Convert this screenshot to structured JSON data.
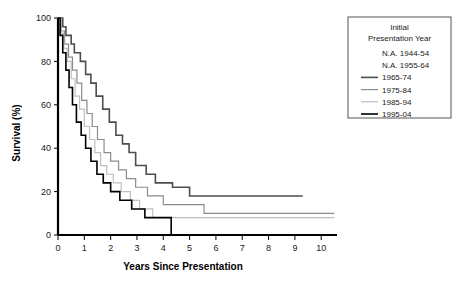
{
  "chart_data": {
    "type": "line",
    "title": "",
    "xlabel": "Years Since Presentation",
    "ylabel": "Survival (%)",
    "xlim": [
      0,
      10.6
    ],
    "ylim": [
      0,
      100
    ],
    "xticks": [
      "0",
      "1",
      "2",
      "3",
      "4",
      "5",
      "6",
      "7",
      "8",
      "9",
      "10"
    ],
    "yticks": [
      "0",
      "20",
      "40",
      "60",
      "80",
      "100"
    ],
    "grid": false,
    "step_style": "post",
    "legend": {
      "position": "top-right",
      "title_line1": "Initial",
      "title_line2": "Presentation Year",
      "entries": [
        {
          "label": "N.A. 1944-54",
          "color": "#ffffff",
          "has_line": false,
          "width": 0
        },
        {
          "label": "N.A. 1955-64",
          "color": "#ffffff",
          "has_line": false,
          "width": 0
        },
        {
          "label": "1965-74",
          "color": "#4d4d4d",
          "has_line": true,
          "width": 1.6
        },
        {
          "label": "1975-84",
          "color": "#8c8c8c",
          "has_line": true,
          "width": 1.2
        },
        {
          "label": "1985-94",
          "color": "#bfbfbf",
          "has_line": true,
          "width": 1.2
        },
        {
          "label": "1995-04",
          "color": "#000000",
          "has_line": true,
          "width": 1.6
        }
      ]
    },
    "series": [
      {
        "name": "1965-74",
        "color": "#4d4d4d",
        "width": 1.6,
        "points": [
          [
            0.0,
            100
          ],
          [
            0.18,
            100
          ],
          [
            0.18,
            96
          ],
          [
            0.3,
            96
          ],
          [
            0.3,
            92
          ],
          [
            0.5,
            92
          ],
          [
            0.5,
            88
          ],
          [
            0.62,
            88
          ],
          [
            0.62,
            84
          ],
          [
            0.85,
            84
          ],
          [
            0.85,
            80
          ],
          [
            1.05,
            80
          ],
          [
            1.05,
            74
          ],
          [
            1.25,
            74
          ],
          [
            1.25,
            70
          ],
          [
            1.45,
            70
          ],
          [
            1.45,
            64
          ],
          [
            1.7,
            64
          ],
          [
            1.7,
            58
          ],
          [
            1.95,
            58
          ],
          [
            1.95,
            52
          ],
          [
            2.2,
            52
          ],
          [
            2.2,
            46
          ],
          [
            2.45,
            46
          ],
          [
            2.45,
            42
          ],
          [
            2.7,
            42
          ],
          [
            2.7,
            38
          ],
          [
            2.95,
            38
          ],
          [
            2.95,
            32
          ],
          [
            3.35,
            32
          ],
          [
            3.35,
            28
          ],
          [
            3.7,
            28
          ],
          [
            3.7,
            24
          ],
          [
            4.35,
            24
          ],
          [
            4.35,
            22
          ],
          [
            5.0,
            22
          ],
          [
            5.0,
            18
          ],
          [
            9.3,
            18
          ]
        ]
      },
      {
        "name": "1975-84",
        "color": "#8c8c8c",
        "width": 1.2,
        "points": [
          [
            0.0,
            100
          ],
          [
            0.12,
            100
          ],
          [
            0.12,
            94
          ],
          [
            0.25,
            94
          ],
          [
            0.25,
            88
          ],
          [
            0.4,
            88
          ],
          [
            0.4,
            82
          ],
          [
            0.55,
            82
          ],
          [
            0.55,
            76
          ],
          [
            0.72,
            76
          ],
          [
            0.72,
            70
          ],
          [
            0.9,
            70
          ],
          [
            0.9,
            62
          ],
          [
            1.1,
            62
          ],
          [
            1.1,
            56
          ],
          [
            1.3,
            56
          ],
          [
            1.3,
            50
          ],
          [
            1.5,
            50
          ],
          [
            1.5,
            44
          ],
          [
            1.75,
            44
          ],
          [
            1.75,
            38
          ],
          [
            2.0,
            38
          ],
          [
            2.0,
            34
          ],
          [
            2.3,
            34
          ],
          [
            2.3,
            30
          ],
          [
            2.6,
            30
          ],
          [
            2.6,
            26
          ],
          [
            2.95,
            26
          ],
          [
            2.95,
            22
          ],
          [
            3.4,
            22
          ],
          [
            3.4,
            18
          ],
          [
            4.0,
            18
          ],
          [
            4.0,
            14
          ],
          [
            5.55,
            14
          ],
          [
            5.55,
            10
          ],
          [
            10.5,
            10
          ]
        ]
      },
      {
        "name": "1985-94",
        "color": "#bfbfbf",
        "width": 1.2,
        "points": [
          [
            0.0,
            100
          ],
          [
            0.1,
            100
          ],
          [
            0.1,
            93
          ],
          [
            0.22,
            93
          ],
          [
            0.22,
            86
          ],
          [
            0.35,
            86
          ],
          [
            0.35,
            80
          ],
          [
            0.5,
            80
          ],
          [
            0.5,
            72
          ],
          [
            0.65,
            72
          ],
          [
            0.65,
            64
          ],
          [
            0.82,
            64
          ],
          [
            0.82,
            58
          ],
          [
            1.0,
            58
          ],
          [
            1.0,
            50
          ],
          [
            1.2,
            50
          ],
          [
            1.2,
            44
          ],
          [
            1.4,
            44
          ],
          [
            1.4,
            38
          ],
          [
            1.62,
            38
          ],
          [
            1.62,
            32
          ],
          [
            1.85,
            32
          ],
          [
            1.85,
            28
          ],
          [
            2.1,
            28
          ],
          [
            2.1,
            24
          ],
          [
            2.4,
            24
          ],
          [
            2.4,
            20
          ],
          [
            2.75,
            20
          ],
          [
            2.75,
            16
          ],
          [
            3.1,
            16
          ],
          [
            3.1,
            12
          ],
          [
            3.6,
            12
          ],
          [
            3.6,
            8
          ],
          [
            10.5,
            8
          ]
        ]
      },
      {
        "name": "1995-04",
        "color": "#000000",
        "width": 1.6,
        "points": [
          [
            0.0,
            100
          ],
          [
            0.08,
            100
          ],
          [
            0.08,
            92
          ],
          [
            0.18,
            92
          ],
          [
            0.18,
            84
          ],
          [
            0.3,
            84
          ],
          [
            0.3,
            76
          ],
          [
            0.42,
            76
          ],
          [
            0.42,
            68
          ],
          [
            0.55,
            68
          ],
          [
            0.55,
            60
          ],
          [
            0.7,
            60
          ],
          [
            0.7,
            52
          ],
          [
            0.88,
            52
          ],
          [
            0.88,
            46
          ],
          [
            1.05,
            46
          ],
          [
            1.05,
            40
          ],
          [
            1.25,
            40
          ],
          [
            1.25,
            34
          ],
          [
            1.48,
            34
          ],
          [
            1.48,
            28
          ],
          [
            1.72,
            28
          ],
          [
            1.72,
            24
          ],
          [
            2.0,
            24
          ],
          [
            2.0,
            20
          ],
          [
            2.35,
            20
          ],
          [
            2.35,
            16
          ],
          [
            2.8,
            16
          ],
          [
            2.8,
            12
          ],
          [
            3.3,
            12
          ],
          [
            3.3,
            8
          ],
          [
            4.3,
            8
          ],
          [
            4.3,
            0
          ]
        ]
      }
    ]
  }
}
